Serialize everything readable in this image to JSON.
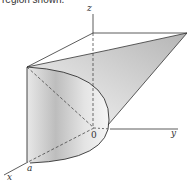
{
  "caption": "region shown.",
  "figure": {
    "labels": {
      "z": "z",
      "y": "y",
      "x": "x",
      "origin": "0",
      "a": "a"
    }
  }
}
